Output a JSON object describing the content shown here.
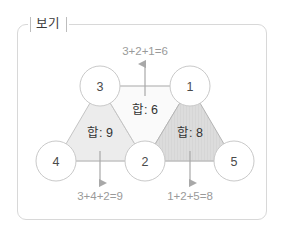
{
  "frame": {
    "legend_label": "보기",
    "border_color": "#d8d8d8",
    "background": "#ffffff"
  },
  "diagram": {
    "type": "triangular-lattice-sum",
    "nodes": [
      {
        "id": "node-3",
        "label": "3",
        "cx": 100,
        "cy": 86,
        "r": 20
      },
      {
        "id": "node-1",
        "label": "1",
        "cx": 190,
        "cy": 86,
        "r": 20
      },
      {
        "id": "node-4",
        "label": "4",
        "cx": 56,
        "cy": 161,
        "r": 20
      },
      {
        "id": "node-2",
        "label": "2",
        "cx": 145,
        "cy": 161,
        "r": 20
      },
      {
        "id": "node-5",
        "label": "5",
        "cx": 234,
        "cy": 161,
        "r": 20
      }
    ],
    "triangles": [
      {
        "id": "triangle-left",
        "sum_label": "합: 9",
        "sum_value": 9,
        "members": [
          3,
          4,
          2
        ],
        "fill": "#ececec",
        "stroke": "#c4c4c4",
        "points": "100,86 56,161 145,161",
        "label_x": 100,
        "label_y": 133
      },
      {
        "id": "triangle-middle",
        "sum_label": "합: 6",
        "sum_value": 6,
        "members": [
          3,
          2,
          1
        ],
        "fill": "#fafafa",
        "stroke": "#c4c4c4",
        "points": "145,161 100,86 190,86",
        "label_x": 145,
        "label_y": 110
      },
      {
        "id": "triangle-right",
        "sum_label": "합: 8",
        "sum_value": 8,
        "members": [
          1,
          2,
          5
        ],
        "fill": "#dcdcdc",
        "stroke": "#b4b4b4",
        "points": "190,86 145,161 234,161",
        "label_x": 190,
        "label_y": 133
      }
    ],
    "edges": [
      {
        "id": "edge-top",
        "x1": 100,
        "y1": 86,
        "x2": 190,
        "y2": 86
      },
      {
        "id": "edge-bottom",
        "x1": 56,
        "y1": 161,
        "x2": 234,
        "y2": 161
      }
    ],
    "annotations": [
      {
        "id": "annotation-top",
        "text": "3+2+1=6",
        "text_x": 145,
        "text_y": 51,
        "arrow": {
          "x": 145,
          "y_from": 96,
          "y_to": 62,
          "direction": "up"
        }
      },
      {
        "id": "annotation-bottom-left",
        "text": "3+4+2=9",
        "text_x": 100,
        "text_y": 196,
        "arrow": {
          "x": 100,
          "y_from": 151,
          "y_to": 185,
          "direction": "down"
        }
      },
      {
        "id": "annotation-bottom-right",
        "text": "1+2+5=8",
        "text_x": 190,
        "text_y": 196,
        "arrow": {
          "x": 190,
          "y_from": 151,
          "y_to": 185,
          "direction": "down"
        }
      }
    ],
    "colors": {
      "node_stroke": "#c9c9c9",
      "node_fill": "#ffffff",
      "edge_stroke": "#c4c4c4",
      "arrow": "#a8a8a8",
      "equation_text": "#9a9a9a",
      "sum_text": "#333333",
      "node_text": "#4a4a4a"
    }
  }
}
